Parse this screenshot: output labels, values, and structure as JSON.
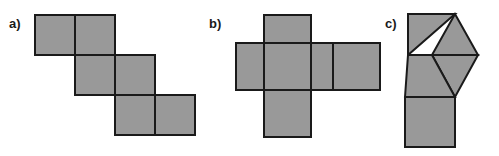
{
  "canvas": {
    "width": 499,
    "height": 156,
    "background": "#ffffff"
  },
  "style": {
    "face_fill": "#999999",
    "face_stroke": "#1a1a1a",
    "stroke_width": 2,
    "label_color": "#1a1a1a"
  },
  "figures": [
    {
      "id": "a",
      "label": "a)",
      "label_x": 9,
      "label_y": 17,
      "description": "staircase net of six squares",
      "face_count": 6,
      "face_shape": "square",
      "cell_size": 40,
      "squares": [
        {
          "name": "square-r1c1",
          "x": 35,
          "y": 15
        },
        {
          "name": "square-r1c2",
          "x": 75,
          "y": 15
        },
        {
          "name": "square-r2c2",
          "x": 75,
          "y": 55
        },
        {
          "name": "square-r2c3",
          "x": 115,
          "y": 55
        },
        {
          "name": "square-r3c3",
          "x": 115,
          "y": 95
        },
        {
          "name": "square-r3c4",
          "x": 155,
          "y": 95
        }
      ]
    },
    {
      "id": "b",
      "label": "b)",
      "label_x": 209,
      "label_y": 17,
      "description": "cross-shaped net of six squares",
      "face_count": 6,
      "face_shape": "square",
      "cell_size": 47,
      "squares": [
        {
          "name": "square-top",
          "x": 264,
          "y": 15
        },
        {
          "name": "square-left",
          "x": 236,
          "y": 43
        },
        {
          "name": "square-center",
          "x": 264,
          "y": 43
        },
        {
          "name": "square-right1",
          "x": 311,
          "y": 43
        },
        {
          "name": "square-right2",
          "x": 333,
          "y": 43
        },
        {
          "name": "square-bottom",
          "x": 264,
          "y": 90
        }
      ]
    },
    {
      "id": "c",
      "label": "c)",
      "label_x": 385,
      "label_y": 17,
      "description": "net of four triangles and one square",
      "face_count": 5,
      "face_shapes": [
        "triangle",
        "triangle",
        "triangle",
        "triangle",
        "square"
      ],
      "triangles": [
        {
          "name": "triangle-upper-left",
          "points": "408,14 455,14 408,55"
        },
        {
          "name": "triangle-upper-right",
          "points": "455,14 478,55 432,55"
        },
        {
          "name": "triangle-mid-right",
          "points": "432,55 478,55 455,97"
        },
        {
          "name": "triangle-mid-left",
          "points": "408,55 432,55 455,97 405,97"
        }
      ],
      "square": {
        "name": "square-bottom",
        "x": 405,
        "y": 97,
        "size": 50
      }
    }
  ]
}
